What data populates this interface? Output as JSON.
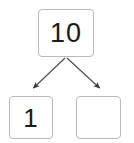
{
  "diagram": {
    "type": "number-bond",
    "background_color": "#ffffff",
    "box_border_color": "#b9b9b9",
    "text_color": "#1a1a1a",
    "arrow_color": "#3a3a3a",
    "nodes": [
      {
        "id": "parent",
        "role": "whole",
        "value": "10",
        "empty": false
      },
      {
        "id": "child-left",
        "role": "part",
        "value": "1",
        "empty": false
      },
      {
        "id": "child-right",
        "role": "part",
        "value": "",
        "empty": true
      }
    ],
    "edges": [
      {
        "id": "edge-left",
        "from": "parent",
        "to": "child-left",
        "arrowhead": "filled-triangle"
      },
      {
        "id": "edge-right",
        "from": "parent",
        "to": "child-right",
        "arrowhead": "filled-triangle"
      }
    ]
  }
}
